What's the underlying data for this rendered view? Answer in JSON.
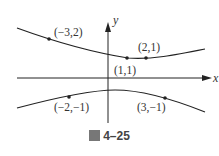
{
  "figure": {
    "caption_icon": "figure-glyph-icon",
    "caption_char": "圖",
    "caption_number": "4–25",
    "axes": {
      "x_label": "x",
      "y_label": "y"
    },
    "points": [
      {
        "id": "p1",
        "label": "(−3,2)",
        "curve": "upper"
      },
      {
        "id": "p2",
        "label": "(1,1)",
        "curve": "upper"
      },
      {
        "id": "p3",
        "label": "(2,1)",
        "curve": "upper"
      },
      {
        "id": "p4",
        "label": "(−2,−1)",
        "curve": "lower"
      },
      {
        "id": "p5",
        "label": "(3,−1)",
        "curve": "lower"
      }
    ],
    "colors": {
      "stroke": "#222222",
      "text": "#333333"
    }
  }
}
